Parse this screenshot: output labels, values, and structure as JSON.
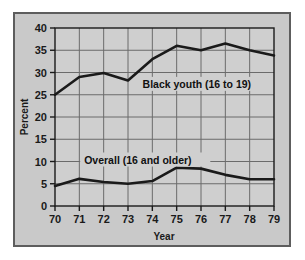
{
  "chart_data": {
    "type": "line",
    "title": "",
    "xlabel": "Year",
    "ylabel": "Percent",
    "x": [
      70,
      71,
      72,
      73,
      74,
      75,
      76,
      77,
      78,
      79
    ],
    "xticklabels": [
      "70",
      "71",
      "72",
      "73",
      "74",
      "75",
      "76",
      "77",
      "78",
      "79"
    ],
    "yticklabels": [
      "0",
      "5",
      "10",
      "15",
      "20",
      "25",
      "30",
      "35",
      "40"
    ],
    "yticks": [
      0,
      5,
      10,
      15,
      20,
      25,
      30,
      35,
      40
    ],
    "xlim": [
      70,
      79
    ],
    "ylim": [
      0,
      40
    ],
    "grid": true,
    "legend_position": "inline-annotation",
    "series": [
      {
        "name": "Black youth (16 to 19)",
        "values": [
          25.0,
          29.0,
          29.9,
          28.2,
          33.0,
          36.0,
          35.0,
          36.5,
          35.0,
          33.8
        ],
        "color": "#1a1a1a"
      },
      {
        "name": "Overall (16 and older)",
        "values": [
          4.5,
          6.1,
          5.4,
          5.0,
          5.6,
          8.6,
          8.4,
          7.0,
          6.0,
          6.0
        ],
        "color": "#1a1a1a"
      }
    ],
    "annotations": [
      {
        "text": "Black youth (16 to 19)",
        "x": 73.6,
        "y": 27.0
      },
      {
        "text": "Overall (16 and older)",
        "x": 71.2,
        "y": 10.0
      }
    ],
    "colors": {
      "figure_background": "#c9c9c9",
      "plot_background": "#cfcfcf",
      "gridline": "#6b6b6b",
      "axis": "#1a1a1a",
      "line": "#1a1a1a",
      "frame_border": "#5d5d5d",
      "page_background": "#ffffff"
    }
  }
}
